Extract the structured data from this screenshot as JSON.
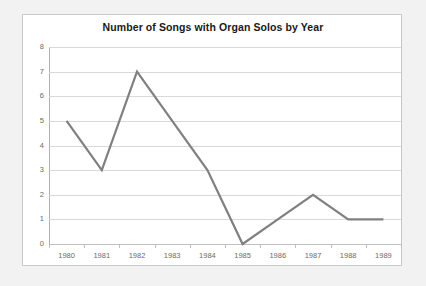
{
  "chart_data": {
    "type": "line",
    "title": "Number of Songs with Organ Solos by Year",
    "xlabel": "",
    "ylabel": "",
    "categories": [
      "1980",
      "1981",
      "1982",
      "1983",
      "1984",
      "1985",
      "1986",
      "1987",
      "1988",
      "1989"
    ],
    "values": [
      5,
      3,
      7,
      5,
      3,
      0,
      1,
      2,
      1,
      1
    ],
    "series": [
      {
        "name": "Number of Songs with Organ Solos",
        "values": [
          5,
          3,
          7,
          5,
          3,
          0,
          1,
          2,
          1,
          1
        ]
      }
    ],
    "ylim": [
      0,
      8
    ],
    "y_ticks": [
      "0",
      "1",
      "2",
      "3",
      "4",
      "5",
      "6",
      "7",
      "8"
    ],
    "grid": "horizontal",
    "legend": "none",
    "line_color": "#808080",
    "gridline_color": "#d9d9d9",
    "axis_color": "#b0b0b0",
    "tick_label_color": "#6b6b6b",
    "title_color": "#1a1a1a",
    "plot_background": "#ffffff",
    "page_background": "#f2f2f2"
  }
}
